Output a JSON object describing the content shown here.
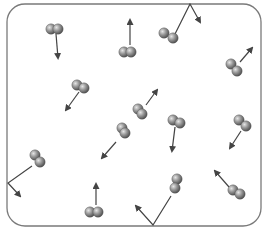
{
  "diagram": {
    "container": {
      "x": 7,
      "y": 4,
      "width": 254,
      "height": 222,
      "radius": 18,
      "stroke": "#7a7a7a"
    },
    "atom_color": "#8c8c8c",
    "arrow_color": "#444444",
    "molecules": [
      {
        "id": "m1",
        "atoms": [
          [
            51,
            29
          ],
          [
            58,
            29
          ]
        ],
        "arrow": [
          [
            56,
            34
          ],
          [
            58,
            58
          ]
        ]
      },
      {
        "id": "m2",
        "atoms": [
          [
            124,
            52
          ],
          [
            131,
            52
          ]
        ],
        "arrow": [
          [
            130,
            45
          ],
          [
            130,
            20
          ]
        ]
      },
      {
        "id": "m3",
        "atoms": [
          [
            164,
            33
          ],
          [
            173,
            38
          ]
        ],
        "arrow": [
          [
            174,
            30
          ],
          [
            190,
            4
          ]
        ]
      },
      {
        "id": "m4",
        "atoms": [
          [
            231,
            64
          ],
          [
            237,
            71
          ]
        ],
        "arrow": [
          [
            240,
            62
          ],
          [
            252,
            48
          ]
        ]
      },
      {
        "id": "m5",
        "atoms": [
          [
            77,
            85
          ],
          [
            84,
            88
          ]
        ],
        "arrow": [
          [
            79,
            92
          ],
          [
            66,
            110
          ]
        ]
      },
      {
        "id": "m6",
        "atoms": [
          [
            138,
            109
          ],
          [
            142,
            114
          ]
        ],
        "arrow": [
          [
            146,
            105
          ],
          [
            157,
            90
          ]
        ]
      },
      {
        "id": "m7",
        "atoms": [
          [
            122,
            128
          ],
          [
            125,
            133
          ]
        ],
        "arrow": [
          [
            116,
            142
          ],
          [
            102,
            158
          ]
        ]
      },
      {
        "id": "m8",
        "atoms": [
          [
            173,
            120
          ],
          [
            180,
            123
          ]
        ],
        "arrow": [
          [
            175,
            127
          ],
          [
            172,
            151
          ]
        ]
      },
      {
        "id": "m9",
        "atoms": [
          [
            239,
            120
          ],
          [
            246,
            126
          ]
        ],
        "arrow": [
          [
            241,
            131
          ],
          [
            230,
            148
          ]
        ]
      },
      {
        "id": "m10",
        "atoms": [
          [
            35,
            155
          ],
          [
            40,
            162
          ]
        ],
        "arrow": [
          [
            32,
            166
          ],
          [
            8,
            183
          ]
        ]
      },
      {
        "id": "m11",
        "atoms": [
          [
            90,
            212
          ],
          [
            98,
            212
          ]
        ],
        "arrow": [
          [
            96,
            205
          ],
          [
            96,
            184
          ]
        ]
      },
      {
        "id": "m12",
        "atoms": [
          [
            177,
            179
          ],
          [
            175,
            188
          ]
        ],
        "arrow": [
          [
            171,
            196
          ],
          [
            153,
            225
          ]
        ]
      },
      {
        "id": "m13",
        "atoms": [
          [
            233,
            190
          ],
          [
            240,
            194
          ]
        ],
        "arrow": [
          [
            229,
            187
          ],
          [
            215,
            171
          ]
        ]
      }
    ],
    "wall_bounces": [
      {
        "id": "b1",
        "path": [
          [
            173,
            38
          ],
          [
            190,
            4
          ],
          [
            200,
            22
          ]
        ]
      },
      {
        "id": "b2",
        "path": [
          [
            32,
            166
          ],
          [
            8,
            183
          ],
          [
            20,
            196
          ]
        ]
      },
      {
        "id": "b3",
        "path": [
          [
            171,
            196
          ],
          [
            153,
            225
          ],
          [
            136,
            206
          ]
        ]
      }
    ]
  }
}
